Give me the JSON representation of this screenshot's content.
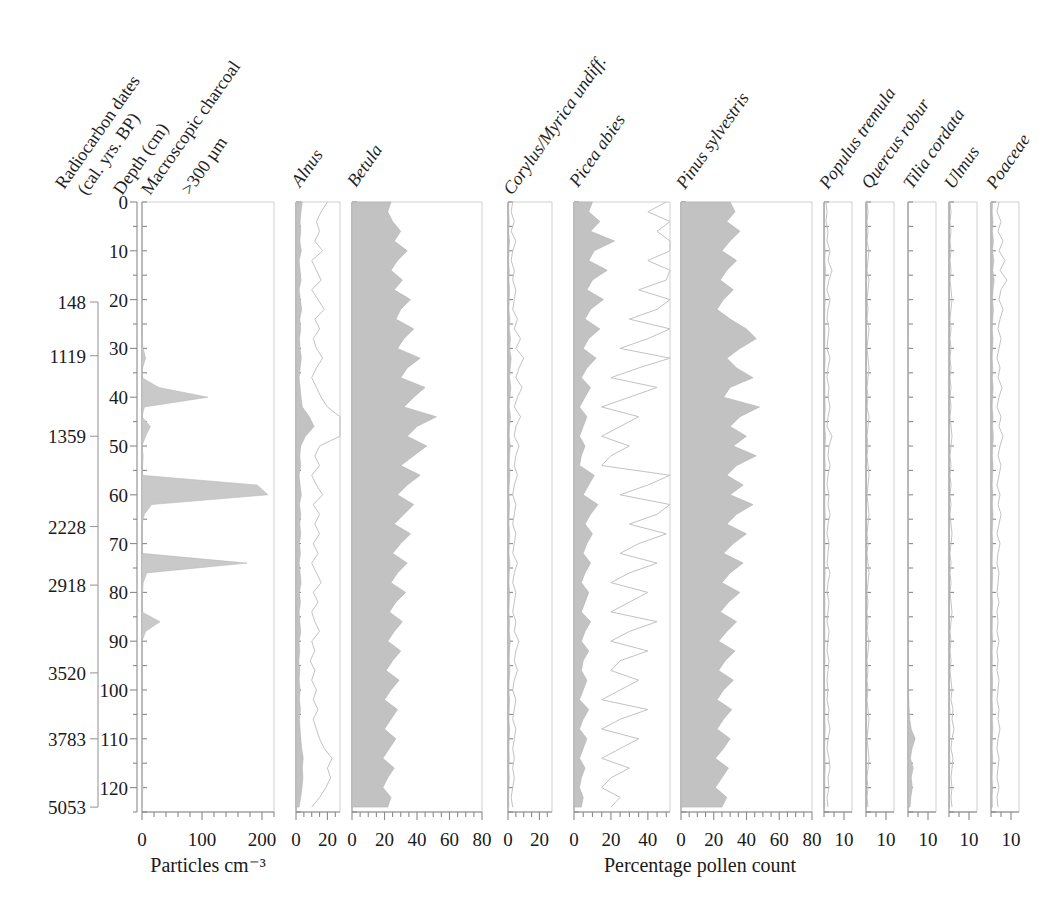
{
  "figure": {
    "kind": "pollen-stratigraphic-diagram",
    "left_axis_titles": [
      "Radiocarbon dates",
      "(cal. yrs. BP)",
      "Depth (cm)"
    ],
    "charcoal_title_lines": [
      "Macroscopic charcoal",
      ">300 µm"
    ],
    "bottom_caption_left": "Particles cm⁻³",
    "bottom_caption_right": "Percentage pollen count"
  },
  "depth_axis": {
    "label": "Depth (cm)",
    "min": 0,
    "max": 125,
    "ticks": [
      0,
      10,
      20,
      30,
      40,
      50,
      60,
      70,
      80,
      90,
      100,
      110,
      120
    ],
    "minor_step": 5
  },
  "radiocarbon_dates": [
    {
      "label": "148",
      "depth": 20.5
    },
    {
      "label": "1119",
      "depth": 31.5
    },
    {
      "label": "1359",
      "depth": 48.0
    },
    {
      "label": "2228",
      "depth": 66.5
    },
    {
      "label": "2918",
      "depth": 78.5
    },
    {
      "label": "3520",
      "depth": 96.5
    },
    {
      "label": "3783",
      "depth": 110.0
    },
    {
      "label": "5053",
      "depth": 124.0
    }
  ],
  "chart_data": {
    "type": "area",
    "xlabel": "Percentage pollen count",
    "ylabel": "Depth (cm)",
    "y_inverted": true,
    "depths": [
      0,
      2,
      4,
      6,
      8,
      10,
      12,
      14,
      16,
      18,
      20,
      22,
      24,
      26,
      28,
      30,
      32,
      34,
      36,
      38,
      40,
      42,
      44,
      46,
      48,
      50,
      52,
      54,
      56,
      58,
      60,
      62,
      64,
      66,
      68,
      70,
      72,
      74,
      76,
      78,
      80,
      82,
      84,
      86,
      88,
      90,
      92,
      94,
      96,
      98,
      100,
      102,
      104,
      106,
      108,
      110,
      112,
      114,
      116,
      118,
      120,
      122,
      124
    ],
    "panels": [
      {
        "name": "macroscopic-charcoal",
        "label_lines": [
          "Macroscopic charcoal",
          ">300 µm"
        ],
        "units": "Particles cm⁻³",
        "xlim": [
          0,
          220
        ],
        "ticks": [
          0,
          100,
          200
        ],
        "tick_labels": [
          "0",
          "100",
          "200"
        ],
        "minor_step": 20,
        "style": "outline",
        "values": [
          0,
          0,
          0,
          0,
          0,
          0,
          0,
          0,
          0,
          0,
          0,
          0,
          0,
          0,
          0,
          2,
          6,
          1,
          0,
          28,
          110,
          4,
          0,
          14,
          6,
          0,
          2,
          1,
          0,
          192,
          210,
          16,
          4,
          0,
          0,
          0,
          0,
          175,
          8,
          2,
          1,
          0,
          0,
          30,
          6,
          0,
          0,
          0,
          0,
          0,
          0,
          0,
          0,
          0,
          0,
          0,
          0,
          0,
          0,
          0,
          2,
          0,
          0
        ]
      },
      {
        "name": "alnus",
        "label": "Alnus",
        "xlim": [
          0,
          28
        ],
        "ticks": [
          0,
          20
        ],
        "tick_labels": [
          "0",
          "20"
        ],
        "minor_step": 5,
        "style": "filled-plus-exaggerated",
        "exaggeration": 5,
        "values": [
          4.0,
          3.2,
          2.6,
          3.0,
          2.4,
          3.4,
          2.0,
          2.6,
          3.2,
          2.0,
          2.8,
          3.6,
          2.4,
          3.0,
          2.2,
          2.6,
          3.4,
          2.6,
          2.0,
          2.6,
          3.2,
          4.0,
          8.5,
          11.5,
          6.0,
          3.0,
          2.4,
          3.0,
          2.0,
          2.6,
          3.4,
          2.2,
          3.0,
          2.4,
          3.0,
          2.2,
          2.8,
          2.0,
          2.6,
          3.2,
          2.2,
          2.8,
          2.0,
          2.4,
          3.0,
          2.0,
          2.4,
          1.8,
          2.4,
          2.0,
          2.6,
          2.2,
          2.8,
          2.2,
          2.6,
          3.0,
          3.6,
          4.6,
          4.0,
          4.4,
          3.8,
          3.0,
          2.0
        ]
      },
      {
        "name": "betula",
        "label": "Betula",
        "xlim": [
          0,
          80
        ],
        "ticks": [
          0,
          20,
          40,
          60,
          80
        ],
        "tick_labels": [
          "0",
          "20",
          "40",
          "60",
          "80"
        ],
        "minor_step": 5,
        "style": "filled",
        "values": [
          24,
          22,
          25,
          30,
          26,
          34,
          28,
          24,
          31,
          26,
          36,
          30,
          27,
          38,
          32,
          28,
          42,
          34,
          30,
          45,
          38,
          32,
          52,
          40,
          34,
          46,
          38,
          30,
          42,
          34,
          28,
          38,
          32,
          26,
          36,
          30,
          25,
          34,
          28,
          24,
          33,
          27,
          23,
          31,
          26,
          22,
          30,
          25,
          21,
          29,
          24,
          20,
          28,
          24,
          20,
          27,
          23,
          19,
          26,
          22,
          19,
          24,
          22
        ]
      },
      {
        "name": "corylus-myrica-undiff",
        "label": "Corylus/Myrica undiff.",
        "xlim": [
          0,
          28
        ],
        "ticks": [
          0,
          20
        ],
        "tick_labels": [
          "0",
          "20"
        ],
        "minor_step": 5,
        "style": "filled-plus-exaggerated",
        "exaggeration": 5,
        "values": [
          0.6,
          0.4,
          0.8,
          0.4,
          1.0,
          0.6,
          0.4,
          0.8,
          0.6,
          1.0,
          0.8,
          0.6,
          1.2,
          0.8,
          1.6,
          1.0,
          2.0,
          1.4,
          1.0,
          1.8,
          1.2,
          0.8,
          1.6,
          1.0,
          0.8,
          1.4,
          1.0,
          0.8,
          1.2,
          0.8,
          0.6,
          1.0,
          0.8,
          0.6,
          1.0,
          0.8,
          0.6,
          1.2,
          0.8,
          0.6,
          1.0,
          0.8,
          0.6,
          1.0,
          0.8,
          1.4,
          1.0,
          0.8,
          1.2,
          0.8,
          0.6,
          1.0,
          0.8,
          0.6,
          1.0,
          0.8,
          0.6,
          0.8,
          0.6,
          0.8,
          0.6,
          0.4,
          0.6
        ]
      },
      {
        "name": "picea-abies",
        "label": "Picea abies",
        "xlim": [
          0,
          52
        ],
        "ticks": [
          0,
          20,
          40
        ],
        "tick_labels": [
          "0",
          "20",
          "40"
        ],
        "minor_step": 5,
        "style": "filled-plus-exaggerated",
        "exaggeration": 5,
        "values": [
          10,
          8,
          14,
          9,
          22,
          11,
          8,
          18,
          10,
          7,
          16,
          9,
          6,
          14,
          8,
          5,
          12,
          7,
          4,
          9,
          6,
          3,
          7,
          5,
          3,
          6,
          4,
          3,
          11,
          8,
          5,
          13,
          9,
          6,
          10,
          7,
          5,
          9,
          6,
          4,
          8,
          6,
          4,
          9,
          6,
          4,
          8,
          5,
          4,
          7,
          5,
          3,
          8,
          5,
          3,
          7,
          5,
          3,
          6,
          4,
          3,
          5,
          4
        ]
      },
      {
        "name": "pinus-sylvestris",
        "label": "Pinus sylvestris",
        "xlim": [
          0,
          80
        ],
        "ticks": [
          0,
          20,
          40,
          60,
          80
        ],
        "tick_labels": [
          "0",
          "20",
          "40",
          "60",
          "80"
        ],
        "minor_step": 5,
        "style": "filled",
        "values": [
          30,
          33,
          28,
          36,
          30,
          25,
          34,
          28,
          24,
          32,
          26,
          22,
          30,
          40,
          46,
          36,
          28,
          34,
          44,
          30,
          26,
          48,
          36,
          30,
          40,
          32,
          46,
          34,
          28,
          38,
          30,
          44,
          34,
          28,
          40,
          32,
          26,
          38,
          30,
          25,
          36,
          29,
          24,
          34,
          28,
          23,
          33,
          27,
          23,
          32,
          26,
          22,
          31,
          26,
          22,
          30,
          26,
          21,
          29,
          25,
          21,
          28,
          25
        ]
      },
      {
        "name": "populus-tremula",
        "label": "Populus tremula",
        "xlim": [
          0,
          14
        ],
        "ticks": [
          10
        ],
        "tick_labels": [
          "10"
        ],
        "minor_step": 5,
        "style": "filled-plus-exaggerated",
        "exaggeration": 5,
        "values": [
          0.2,
          0.3,
          0.2,
          0.4,
          0.3,
          0.6,
          0.4,
          0.8,
          0.5,
          0.3,
          0.6,
          0.4,
          0.3,
          0.5,
          0.4,
          0.3,
          0.6,
          0.4,
          0.3,
          0.5,
          0.4,
          0.6,
          0.4,
          0.3,
          0.8,
          0.5,
          0.4,
          0.6,
          0.4,
          0.3,
          0.5,
          0.4,
          0.6,
          0.4,
          0.3,
          0.5,
          0.4,
          0.3,
          0.6,
          0.4,
          0.3,
          0.5,
          0.4,
          0.3,
          0.5,
          0.4,
          0.3,
          0.5,
          0.4,
          0.3,
          0.4,
          0.3,
          0.5,
          0.4,
          0.6,
          0.4,
          0.3,
          0.5,
          0.6,
          0.4,
          0.5,
          0.3,
          0.4
        ]
      },
      {
        "name": "quercus-robur",
        "label": "Quercus robur",
        "xlim": [
          0,
          14
        ],
        "ticks": [
          10
        ],
        "tick_labels": [
          "10"
        ],
        "minor_step": 5,
        "style": "filled-plus-exaggerated",
        "exaggeration": 5,
        "values": [
          0.1,
          0.2,
          0.1,
          0.2,
          0.1,
          0.3,
          0.2,
          0.1,
          0.3,
          0.2,
          0.1,
          0.2,
          0.1,
          0.3,
          0.2,
          0.1,
          0.2,
          0.3,
          0.2,
          0.1,
          0.2,
          0.1,
          0.3,
          0.2,
          0.1,
          0.2,
          0.1,
          0.2,
          0.3,
          0.2,
          0.1,
          0.2,
          0.3,
          0.2,
          0.1,
          0.2,
          0.1,
          0.2,
          0.3,
          0.2,
          0.1,
          0.2,
          0.1,
          0.2,
          0.1,
          0.3,
          0.2,
          0.1,
          0.2,
          0.1,
          0.2,
          0.1,
          0.2,
          0.3,
          0.2,
          0.1,
          0.2,
          0.3,
          0.2,
          0.1,
          0.2,
          0.1,
          0.2
        ]
      },
      {
        "name": "tilia-cordata",
        "label": "Tilia cordata",
        "xlim": [
          0,
          14
        ],
        "ticks": [
          10
        ],
        "tick_labels": [
          "10"
        ],
        "minor_step": 5,
        "style": "filled",
        "values": [
          0.1,
          0.1,
          0.2,
          0.1,
          0.2,
          0.1,
          0.2,
          0.1,
          0.2,
          0.1,
          0.2,
          0.1,
          0.2,
          0.1,
          0.2,
          0.1,
          0.2,
          0.1,
          0.3,
          0.2,
          0.1,
          0.2,
          0.1,
          0.2,
          0.1,
          0.2,
          0.3,
          0.2,
          0.1,
          0.2,
          0.1,
          0.2,
          0.1,
          0.3,
          0.2,
          0.1,
          0.2,
          0.1,
          0.2,
          0.1,
          0.2,
          0.3,
          0.2,
          0.1,
          0.2,
          0.1,
          0.2,
          0.3,
          0.2,
          0.1,
          0.2,
          0.4,
          0.6,
          0.9,
          1.6,
          3.6,
          2.0,
          1.2,
          2.6,
          1.6,
          2.2,
          1.4,
          1.0
        ]
      },
      {
        "name": "ulmus",
        "label": "Ulmus",
        "xlim": [
          0,
          14
        ],
        "ticks": [
          10
        ],
        "tick_labels": [
          "10"
        ],
        "minor_step": 5,
        "style": "filled-plus-exaggerated",
        "exaggeration": 5,
        "values": [
          0.1,
          0.2,
          0.1,
          0.2,
          0.1,
          0.2,
          0.1,
          0.2,
          0.1,
          0.2,
          0.3,
          0.2,
          0.1,
          0.2,
          0.1,
          0.2,
          0.1,
          0.2,
          0.1,
          0.2,
          0.1,
          0.2,
          0.1,
          0.2,
          0.3,
          0.2,
          0.1,
          0.2,
          0.1,
          0.2,
          0.1,
          0.2,
          0.1,
          0.2,
          0.3,
          0.2,
          0.1,
          0.2,
          0.1,
          0.2,
          0.1,
          0.2,
          0.3,
          0.2,
          0.1,
          0.2,
          0.1,
          0.2,
          0.1,
          0.2,
          0.3,
          0.2,
          0.4,
          0.3,
          0.5,
          0.3,
          0.2,
          0.4,
          0.3,
          0.2,
          0.3,
          0.2,
          0.3
        ]
      },
      {
        "name": "poaceae",
        "label": "Poaceae",
        "xlim": [
          0,
          14
        ],
        "ticks": [
          10
        ],
        "tick_labels": [
          "10"
        ],
        "minor_step": 5,
        "style": "filled-plus-exaggerated",
        "exaggeration": 5,
        "values": [
          0.8,
          0.6,
          1.0,
          0.7,
          1.2,
          0.8,
          1.4,
          0.9,
          1.6,
          1.0,
          0.8,
          1.2,
          0.9,
          0.7,
          1.0,
          0.8,
          0.6,
          0.9,
          0.7,
          1.1,
          0.8,
          0.6,
          1.0,
          0.8,
          1.2,
          0.9,
          0.7,
          1.0,
          0.8,
          0.6,
          0.9,
          0.7,
          1.0,
          0.8,
          0.6,
          0.9,
          0.7,
          0.6,
          0.8,
          0.7,
          0.6,
          0.8,
          0.6,
          0.7,
          0.6,
          0.8,
          0.6,
          0.7,
          0.6,
          0.8,
          0.7,
          0.6,
          0.8,
          0.7,
          0.9,
          0.7,
          0.6,
          0.8,
          0.7,
          0.6,
          0.8,
          0.6,
          0.7
        ]
      }
    ]
  }
}
